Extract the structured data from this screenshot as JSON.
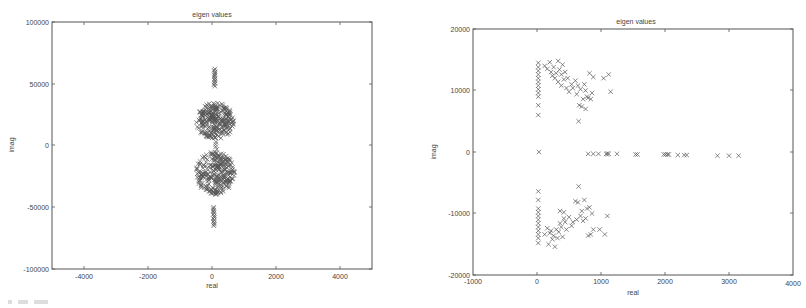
{
  "chart_data": [
    {
      "type": "scatter",
      "title": "eigen values",
      "xlabel": "real",
      "ylabel": "imag",
      "xlim": [
        -5000,
        5000
      ],
      "ylim": [
        -100000,
        100000
      ],
      "xticks": [
        -4000,
        -2000,
        0,
        2000,
        4000
      ],
      "yticks": [
        -100000,
        -50000,
        0,
        50000,
        100000
      ],
      "xtick_labels": [
        "-4000",
        "-2000",
        "0",
        "2000",
        "4000"
      ],
      "ytick_labels": [
        "-100000",
        "-50000",
        "0",
        "50000",
        "100000"
      ],
      "grid": false,
      "legend": null,
      "marker": "x",
      "description": "Dense clusters of eigenvalues near real 0 (spread about -500..700), imag roughly +5000..+35000 and -5000..-40000; vertical strips near real ~80 at imag +48000..+62000 and -50000..-65000; a few points near imag 0.",
      "clusters": [
        {
          "name": "upper-cluster",
          "real_range": [
            -500,
            700
          ],
          "imag_range": [
            5000,
            35000
          ]
        },
        {
          "name": "lower-cluster",
          "real_range": [
            -500,
            700
          ],
          "imag_range": [
            -40000,
            -5000
          ]
        },
        {
          "name": "upper-strip",
          "real_range": [
            60,
            100
          ],
          "imag_range": [
            48000,
            62000
          ]
        },
        {
          "name": "lower-strip",
          "real_range": [
            40,
            80
          ],
          "imag_range": [
            -65000,
            -50000
          ]
        },
        {
          "name": "near-zero",
          "real_range": [
            50,
            150
          ],
          "imag_range": [
            -3000,
            3000
          ]
        }
      ]
    },
    {
      "type": "scatter",
      "title": "eigen values",
      "xlabel": "real",
      "ylabel": "imag",
      "xlim": [
        -1000,
        4000
      ],
      "ylim": [
        -20000,
        20000
      ],
      "xticks": [
        -1000,
        0,
        1000,
        2000,
        3000,
        4000
      ],
      "yticks": [
        -20000,
        -10000,
        0,
        10000,
        20000
      ],
      "xtick_labels": [
        "-1000",
        "0",
        "1000",
        "2000",
        "3000",
        "4000"
      ],
      "ytick_labels": [
        "-20000",
        "-10000",
        "0",
        "10000",
        "20000"
      ],
      "grid": false,
      "legend": null,
      "marker": "x",
      "points_real_axis": [
        [
          30,
          0
        ],
        [
          800,
          -300
        ],
        [
          880,
          -300
        ],
        [
          960,
          -300
        ],
        [
          1080,
          -300
        ],
        [
          1100,
          -300
        ],
        [
          1120,
          -300
        ],
        [
          1250,
          -300
        ],
        [
          1540,
          -400
        ],
        [
          1570,
          -400
        ],
        [
          1980,
          -400
        ],
        [
          2010,
          -400
        ],
        [
          2040,
          -400
        ],
        [
          2060,
          -400
        ],
        [
          2200,
          -500
        ],
        [
          2300,
          -500
        ],
        [
          2340,
          -500
        ],
        [
          2820,
          -600
        ],
        [
          3000,
          -600
        ],
        [
          3150,
          -600
        ]
      ],
      "points_upper": [
        [
          20,
          14500
        ],
        [
          20,
          13800
        ],
        [
          20,
          13200
        ],
        [
          20,
          12600
        ],
        [
          20,
          12000
        ],
        [
          20,
          11400
        ],
        [
          20,
          10800
        ],
        [
          20,
          10200
        ],
        [
          20,
          9600
        ],
        [
          20,
          9000
        ],
        [
          20,
          7600
        ],
        [
          20,
          6000
        ],
        [
          120,
          14000
        ],
        [
          160,
          13500
        ],
        [
          200,
          14600
        ],
        [
          220,
          13000
        ],
        [
          240,
          12400
        ],
        [
          260,
          13800
        ],
        [
          280,
          12000
        ],
        [
          300,
          12800
        ],
        [
          330,
          14800
        ],
        [
          350,
          13400
        ],
        [
          380,
          12600
        ],
        [
          400,
          14200
        ],
        [
          420,
          11800
        ],
        [
          440,
          13000
        ],
        [
          460,
          10400
        ],
        [
          480,
          12000
        ],
        [
          380,
          10800
        ],
        [
          330,
          11400
        ],
        [
          500,
          9800
        ],
        [
          540,
          11000
        ],
        [
          560,
          10400
        ],
        [
          600,
          11600
        ],
        [
          620,
          9400
        ],
        [
          640,
          10800
        ],
        [
          660,
          7600
        ],
        [
          680,
          10200
        ],
        [
          700,
          7400
        ],
        [
          720,
          8600
        ],
        [
          740,
          11000
        ],
        [
          760,
          10000
        ],
        [
          780,
          9000
        ],
        [
          800,
          8800
        ],
        [
          820,
          12800
        ],
        [
          840,
          8600
        ],
        [
          860,
          9600
        ],
        [
          880,
          12200
        ],
        [
          650,
          5000
        ],
        [
          1040,
          12000
        ],
        [
          1120,
          12600
        ],
        [
          1150,
          9800
        ],
        [
          760,
          7000
        ]
      ],
      "points_lower": [
        [
          20,
          -6400
        ],
        [
          20,
          -7800
        ],
        [
          20,
          -9200
        ],
        [
          20,
          -9800
        ],
        [
          20,
          -10400
        ],
        [
          20,
          -11000
        ],
        [
          20,
          -11600
        ],
        [
          20,
          -12200
        ],
        [
          20,
          -12800
        ],
        [
          20,
          -13400
        ],
        [
          20,
          -14000
        ],
        [
          20,
          -14800
        ],
        [
          120,
          -13400
        ],
        [
          160,
          -12400
        ],
        [
          180,
          -15000
        ],
        [
          200,
          -13200
        ],
        [
          220,
          -12800
        ],
        [
          240,
          -14200
        ],
        [
          260,
          -13600
        ],
        [
          280,
          -15400
        ],
        [
          300,
          -12600
        ],
        [
          320,
          -14000
        ],
        [
          340,
          -13000
        ],
        [
          360,
          -11600
        ],
        [
          380,
          -12200
        ],
        [
          400,
          -13800
        ],
        [
          420,
          -10800
        ],
        [
          440,
          -11400
        ],
        [
          460,
          -12600
        ],
        [
          360,
          -9600
        ],
        [
          420,
          -9800
        ],
        [
          500,
          -10600
        ],
        [
          540,
          -12000
        ],
        [
          560,
          -11400
        ],
        [
          600,
          -8000
        ],
        [
          620,
          -11000
        ],
        [
          640,
          -8200
        ],
        [
          650,
          -5600
        ],
        [
          680,
          -10400
        ],
        [
          700,
          -9600
        ],
        [
          720,
          -11200
        ],
        [
          740,
          -7800
        ],
        [
          760,
          -10800
        ],
        [
          780,
          -9200
        ],
        [
          800,
          -13600
        ],
        [
          820,
          -9000
        ],
        [
          840,
          -13400
        ],
        [
          860,
          -10000
        ],
        [
          880,
          -12600
        ],
        [
          980,
          -12600
        ],
        [
          1060,
          -13400
        ],
        [
          1100,
          -10400
        ]
      ]
    }
  ],
  "charts": [
    {
      "title": "eigen values",
      "xlabel": "real",
      "ylabel": "imag",
      "xtick_labels": [
        "-4000",
        "-2000",
        "0",
        "2000",
        "4000"
      ],
      "ytick_labels": [
        "100000",
        "50000",
        "0",
        "-50000",
        "-100000"
      ]
    },
    {
      "title": "eigen values",
      "xlabel": "real",
      "ylabel": "imag",
      "xtick_labels": [
        "-1000",
        "0",
        "1000",
        "2000",
        "3000",
        "4000"
      ],
      "ytick_labels": [
        "20000",
        "10000",
        "0",
        "-10000",
        "-20000"
      ]
    }
  ]
}
